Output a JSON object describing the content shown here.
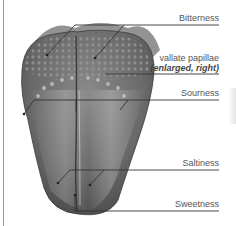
{
  "diagram": {
    "labels": [
      {
        "id": "bitterness",
        "text": "Bitterness"
      },
      {
        "id": "vallate",
        "text": "vallate papillae"
      },
      {
        "id": "vallate_note",
        "text": "(enlarged, right)"
      },
      {
        "id": "sourness",
        "text": "Sourness"
      },
      {
        "id": "saltiness",
        "text": "Saltiness"
      },
      {
        "id": "sweetness",
        "text": "Sweetness"
      }
    ],
    "colors": {
      "leader_line": "#333333",
      "label_text": "#555555",
      "tongue_dark": "#5e5e5e",
      "tongue_light": "#b8b8b8",
      "frame": "#9a9a9a"
    }
  }
}
